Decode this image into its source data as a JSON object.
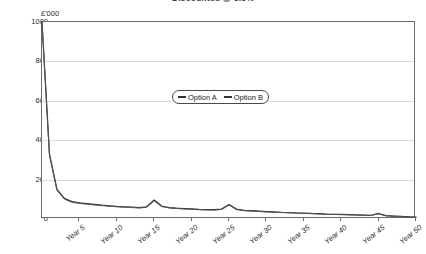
{
  "chart_title": "Discounted @ 3.5%",
  "y_axis": {
    "unit_label": "£'000",
    "ticks": [
      0,
      200,
      400,
      600,
      800,
      1000
    ],
    "min": 0,
    "max": 1000
  },
  "x_axis": {
    "ticks": [
      "Year 5",
      "Year 10",
      "Year 15",
      "Year 20",
      "Year 25",
      "Year 30",
      "Year 35",
      "Year 40",
      "Year 45",
      "Year 50"
    ],
    "min": 0,
    "max": 50
  },
  "legend": {
    "entries": [
      {
        "label": "Option A",
        "color": "#333333"
      },
      {
        "label": "Option B",
        "color": "#333333"
      }
    ]
  },
  "chart_data": {
    "type": "line",
    "title": "Discounted @ 3.5%",
    "xlabel": "",
    "ylabel": "£'000",
    "ylim": [
      0,
      1000
    ],
    "xlim": [
      0,
      50
    ],
    "grid": true,
    "legend_position": "inside-top-center",
    "x": [
      0,
      1,
      2,
      3,
      4,
      5,
      6,
      7,
      8,
      9,
      10,
      11,
      12,
      13,
      14,
      15,
      16,
      17,
      18,
      19,
      20,
      21,
      22,
      23,
      24,
      25,
      26,
      27,
      28,
      29,
      30,
      31,
      32,
      33,
      34,
      35,
      36,
      37,
      38,
      39,
      40,
      41,
      42,
      43,
      44,
      45,
      46,
      47,
      48,
      49,
      50
    ],
    "series": [
      {
        "name": "Option A",
        "color": "#333333",
        "values": [
          1000,
          330,
          150,
          105,
          88,
          82,
          78,
          74,
          70,
          67,
          64,
          62,
          60,
          58,
          62,
          96,
          66,
          58,
          55,
          53,
          51,
          49,
          48,
          47,
          50,
          74,
          50,
          44,
          42,
          40,
          38,
          36,
          34,
          33,
          31,
          30,
          28,
          27,
          25,
          24,
          23,
          22,
          21,
          20,
          19,
          28,
          17,
          15,
          13,
          11,
          9
        ]
      },
      {
        "name": "Option B",
        "color": "#555555",
        "values": [
          1000,
          322,
          146,
          101,
          85,
          79,
          75,
          71,
          68,
          65,
          62,
          60,
          58,
          56,
          60,
          92,
          63,
          56,
          53,
          51,
          49,
          47,
          46,
          45,
          48,
          71,
          48,
          42,
          40,
          38,
          36,
          34,
          33,
          31,
          30,
          28,
          27,
          25,
          24,
          23,
          22,
          21,
          20,
          19,
          18,
          26,
          16,
          14,
          12,
          10,
          8
        ]
      }
    ]
  }
}
